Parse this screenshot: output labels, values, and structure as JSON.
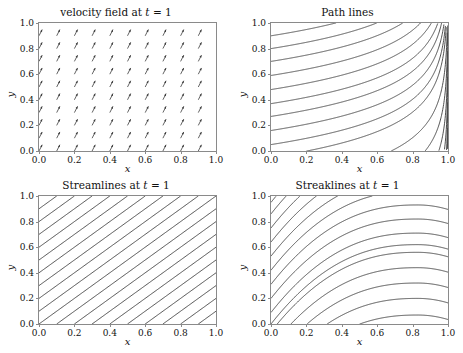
{
  "figure": {
    "background": "#ffffff",
    "line_color": "#3b3b3b",
    "axis_color": "#8a8a8a",
    "text_color": "#111111"
  },
  "panels": [
    {
      "id": "velocity-field",
      "title_prefix": "velocity field at ",
      "title_var": "t",
      "title_suffix": " = 1",
      "xlabel": "x",
      "ylabel": "y"
    },
    {
      "id": "path-lines",
      "title_prefix": "Path lines",
      "title_var": "",
      "title_suffix": "",
      "xlabel": "x",
      "ylabel": "y"
    },
    {
      "id": "streamlines",
      "title_prefix": "Streamlines at ",
      "title_var": "t",
      "title_suffix": " = 1",
      "xlabel": "x",
      "ylabel": "y"
    },
    {
      "id": "streaklines",
      "title_prefix": "Streaklines at ",
      "title_var": "t",
      "title_suffix": " = 1",
      "xlabel": "x",
      "ylabel": "y"
    }
  ],
  "chart_data": [
    {
      "type": "scatter",
      "subtype": "quiver",
      "title": "velocity field at t = 1",
      "xlabel": "x",
      "ylabel": "y",
      "xlim": [
        0,
        1
      ],
      "ylim": [
        0,
        1
      ],
      "xticks": [
        0.0,
        0.2,
        0.4,
        0.6,
        0.8,
        1.0
      ],
      "yticks": [
        0.0,
        0.2,
        0.4,
        0.6,
        0.8,
        1.0
      ],
      "xtick_labels": [
        "0.0",
        "0.2",
        "0.4",
        "0.6",
        "0.8",
        "1.0"
      ],
      "ytick_labels": [
        "0.0",
        "0.2",
        "0.4",
        "0.6",
        "0.8",
        "1.0"
      ],
      "grid": false,
      "legend": null,
      "grid_x": [
        0.0,
        0.1,
        0.2,
        0.3,
        0.4,
        0.5,
        0.6,
        0.7,
        0.8,
        0.9
      ],
      "grid_y": [
        0.0,
        0.1,
        0.2,
        0.3,
        0.4,
        0.5,
        0.6,
        0.7,
        0.8,
        0.9
      ],
      "arrow_u": 0.5,
      "arrow_v": 1.0,
      "arrow_angle_deg": 63,
      "arrow_length_px": 7,
      "note": "uniform arrows, all identical direction up-and-right"
    },
    {
      "type": "line",
      "subtype": "path-lines",
      "title": "Path lines",
      "xlabel": "x",
      "ylabel": "y",
      "xlim": [
        0,
        1
      ],
      "ylim": [
        0,
        1
      ],
      "xticks": [
        0.0,
        0.2,
        0.4,
        0.6,
        0.8,
        1.0
      ],
      "yticks": [
        0.0,
        0.2,
        0.4,
        0.6,
        0.8,
        1.0
      ],
      "grid": false,
      "legend": null,
      "curve_form": "y = y0 - k*ln(1-x), asymptotically vertical at x=1",
      "k": 0.22,
      "y0_values": [
        -1.25,
        -1.05,
        -0.85,
        -0.65,
        -0.45,
        -0.25,
        -0.05,
        0.05,
        0.16,
        0.27,
        0.37,
        0.48,
        0.59,
        0.7,
        0.8,
        0.9
      ],
      "series": [
        {
          "name": "pathline-1",
          "y0": 0.05
        },
        {
          "name": "pathline-2",
          "y0": 0.16
        },
        {
          "name": "pathline-3",
          "y0": 0.27
        },
        {
          "name": "pathline-4",
          "y0": 0.37
        },
        {
          "name": "pathline-5",
          "y0": 0.48
        },
        {
          "name": "pathline-6",
          "y0": 0.59
        },
        {
          "name": "pathline-7",
          "y0": 0.7
        },
        {
          "name": "pathline-8",
          "y0": 0.8
        },
        {
          "name": "pathline-9",
          "y0": 0.9
        }
      ]
    },
    {
      "type": "line",
      "subtype": "streamlines",
      "title": "Streamlines at t = 1",
      "xlabel": "x",
      "ylabel": "y",
      "xlim": [
        0,
        1
      ],
      "ylim": [
        0,
        1
      ],
      "xticks": [
        0.0,
        0.2,
        0.4,
        0.6,
        0.8,
        1.0
      ],
      "yticks": [
        0.0,
        0.2,
        0.4,
        0.6,
        0.8,
        1.0
      ],
      "grid": false,
      "legend": null,
      "curve_form": "straight lines y = x + c, slope 1",
      "slope": 1.0,
      "intercepts": [
        -0.9,
        -0.7,
        -0.5,
        -0.3,
        -0.1,
        0.1,
        0.3,
        0.5,
        0.7,
        0.9,
        0.0,
        -0.2,
        -0.4,
        -0.6,
        -0.8,
        0.2,
        0.4,
        0.6,
        0.8
      ]
    },
    {
      "type": "line",
      "subtype": "streaklines",
      "title": "Streaklines at t = 1",
      "xlabel": "x",
      "ylabel": "y",
      "xlim": [
        0,
        1
      ],
      "ylim": [
        0,
        1
      ],
      "xticks": [
        0.0,
        0.2,
        0.4,
        0.6,
        0.8,
        1.0
      ],
      "yticks": [
        0.0,
        0.2,
        0.4,
        0.6,
        0.8,
        1.0
      ],
      "grid": false,
      "legend": null,
      "curve_form": "rises steeply then peaks near x=0.83 and bends down slightly",
      "peak_x": 0.83,
      "rise": 0.62,
      "drop_after_peak": 0.035,
      "y0_values": [
        -0.55,
        -0.42,
        -0.3,
        -0.18,
        -0.06,
        0.0,
        0.09,
        0.2,
        0.31,
        0.42,
        0.53,
        0.64,
        0.75,
        0.86,
        0.95
      ]
    }
  ]
}
